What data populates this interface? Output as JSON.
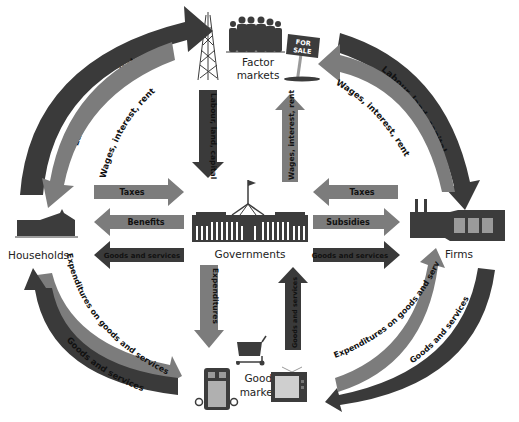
{
  "diagram": {
    "colors": {
      "dark_arrow": "#3a3a3a",
      "mid_arrow": "#7c7c7c",
      "icon": "#3c3c3c",
      "icon_light": "#9a9a9a",
      "background": "#ffffff"
    },
    "nodes": {
      "households": "Households",
      "firms": "Firms",
      "governments": "Governments",
      "factor_markets_line1": "Factor",
      "factor_markets_line2": "markets",
      "goods_markets_line1": "Goods",
      "goods_markets_line2": "markets",
      "for_sale_line1": "FOR",
      "for_sale_line2": "SALE"
    },
    "flows": {
      "hh_to_factor": "Labour, land, capital",
      "factor_to_hh": "Wages, interest, rent",
      "firms_to_factor": "Wages, interest, rent",
      "factor_to_firms": "Labour, land, capital",
      "factor_to_gov": "Labour, land, capital",
      "gov_to_factor": "Wages, interest, rent",
      "hh_to_gov_taxes": "Taxes",
      "gov_to_hh_benefits": "Benefits",
      "gov_to_hh_goods": "Goods and services",
      "firms_to_gov_taxes": "Taxes",
      "gov_to_firms_subsidies": "Subsidies",
      "gov_to_firms_goods": "Goods and services",
      "gov_to_goods_expenditures": "Expenditures",
      "goods_to_gov": "Goods and services",
      "hh_to_goods": "Expenditures on goods and services",
      "goods_to_hh": "Goods and services",
      "goods_to_firms": "Expenditures on goods and services",
      "firms_to_goods": "Goods and services"
    }
  }
}
